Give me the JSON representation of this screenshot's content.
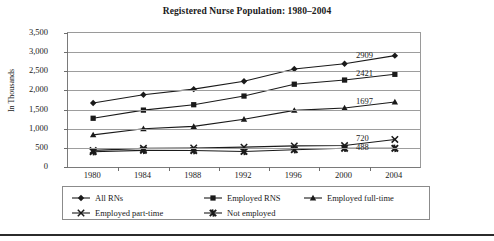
{
  "chart_data": {
    "type": "line",
    "title": "Registered Nurse Population: 1980–2004",
    "xlabel": "",
    "ylabel": "In Thousands",
    "categories": [
      "1980",
      "1984",
      "1988",
      "1992",
      "1996",
      "2000",
      "2004"
    ],
    "x": [
      1980,
      1984,
      1988,
      1992,
      1996,
      2000,
      2004
    ],
    "ylim": [
      0,
      3500
    ],
    "yticks": [
      0,
      500,
      1000,
      1500,
      2000,
      2500,
      3000,
      3500
    ],
    "ytick_labels": [
      "0",
      "500",
      "1,000",
      "1,500",
      "2,000",
      "2,500",
      "3,000",
      "3,500"
    ],
    "grid": true,
    "legend_position": "bottom",
    "series": [
      {
        "name": "All RNs",
        "marker": "diamond",
        "values": [
          1673,
          1888,
          2033,
          2239,
          2559,
          2696,
          2909
        ],
        "end_label": "2909"
      },
      {
        "name": "Employed RNS",
        "marker": "square",
        "values": [
          1273,
          1486,
          1627,
          1853,
          2162,
          2271,
          2421
        ],
        "end_label": "2421"
      },
      {
        "name": "Employed full-time",
        "marker": "triangle",
        "values": [
          840,
          1000,
          1060,
          1249,
          1480,
          1540,
          1697
        ],
        "end_label": "1697"
      },
      {
        "name": "Employed part-time",
        "marker": "x",
        "values": [
          433,
          487,
          497,
          519,
          551,
          560,
          720
        ],
        "end_label": "720"
      },
      {
        "name": "Not employed",
        "marker": "asterisk",
        "values": [
          399,
          435,
          430,
          406,
          452,
          489,
          488
        ],
        "end_label": "488"
      }
    ]
  },
  "colors": {
    "series_line": "#1a1a1a",
    "gridline": "#9d9d9d",
    "axis": "#6e6e6e",
    "text": "#1a1a1a",
    "background": "#ffffff"
  }
}
